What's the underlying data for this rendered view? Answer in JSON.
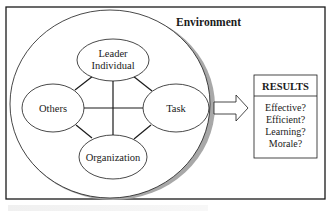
{
  "diagram": {
    "environment_label": "Environment",
    "nodes": {
      "leader": [
        "Leader",
        "Individual"
      ],
      "others": "Others",
      "task": "Task",
      "organization": "Organization"
    },
    "results": {
      "title": "RESULTS",
      "items": [
        "Effective?",
        "Efficient?",
        "Learning?",
        "Morale?"
      ]
    }
  },
  "colors": {
    "stroke": "#1a1a1a",
    "shadow": "#a8a8a8",
    "background": "#ffffff"
  }
}
